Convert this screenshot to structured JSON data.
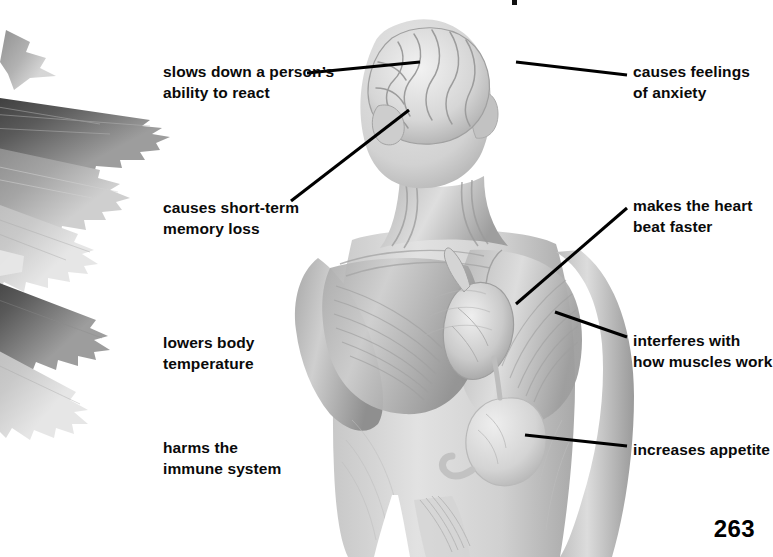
{
  "figure": {
    "page_number": "263",
    "palette": {
      "background": "#ffffff",
      "text": "#0a0a0a",
      "leader_line": "#000000",
      "body_light": "#dcdcdc",
      "body_mid": "#b9b9b9",
      "body_dark": "#8e8e8e",
      "leaf_light": "#c9c9c9",
      "leaf_mid": "#8a8a8a",
      "leaf_dark": "#3a3a3a"
    }
  },
  "illustration": {
    "plant": {
      "name": "cannabis-leaf-photograph",
      "description": "grayscale serrated cannabis leaves, upper-left corner"
    },
    "body": {
      "name": "anatomical-figure",
      "description": "grayscale head, torso and muscle anatomy with exposed brain, heart and stomach"
    },
    "organs": [
      {
        "name": "brain",
        "label": "brain"
      },
      {
        "name": "heart",
        "label": "heart"
      },
      {
        "name": "stomach",
        "label": "stomach"
      },
      {
        "name": "muscles",
        "label": "muscles"
      }
    ]
  },
  "callouts": {
    "left": [
      {
        "id": "slows-reaction",
        "text": "slows down a person’s\nability to react",
        "x": 163,
        "y": 62,
        "line": {
          "x1": 307,
          "y1": 73,
          "x2": 420,
          "y2": 62
        },
        "target": "brain"
      },
      {
        "id": "short-term-memory-loss",
        "text": "causes short-term\nmemory loss",
        "x": 163,
        "y": 198,
        "line": {
          "x1": 291,
          "y1": 201,
          "x2": 409,
          "y2": 110
        },
        "target": "brain"
      },
      {
        "id": "lowers-body-temperature",
        "text": "lowers body\ntemperature",
        "x": 163,
        "y": 333,
        "line": null,
        "target": "body"
      },
      {
        "id": "harms-immune-system",
        "text": "harms the\nimmune system",
        "x": 163,
        "y": 438,
        "line": null,
        "target": "body"
      }
    ],
    "right": [
      {
        "id": "causes-anxiety",
        "text": "causes feelings\nof anxiety",
        "x": 633,
        "y": 62,
        "line": {
          "x1": 627,
          "y1": 75,
          "x2": 516,
          "y2": 62
        },
        "target": "brain"
      },
      {
        "id": "heart-beats-faster",
        "text": "makes the heart\nbeat faster",
        "x": 633,
        "y": 196,
        "line": {
          "x1": 627,
          "y1": 208,
          "x2": 516,
          "y2": 304
        },
        "target": "heart"
      },
      {
        "id": "interferes-with-muscles",
        "text": "interferes with\nhow muscles work",
        "x": 633,
        "y": 331,
        "line": {
          "x1": 627,
          "y1": 337,
          "x2": 555,
          "y2": 312
        },
        "target": "muscles"
      },
      {
        "id": "increases-appetite",
        "text": "increases appetite",
        "x": 633,
        "y": 440,
        "line": {
          "x1": 627,
          "y1": 446,
          "x2": 525,
          "y2": 435
        },
        "target": "stomach"
      }
    ]
  }
}
